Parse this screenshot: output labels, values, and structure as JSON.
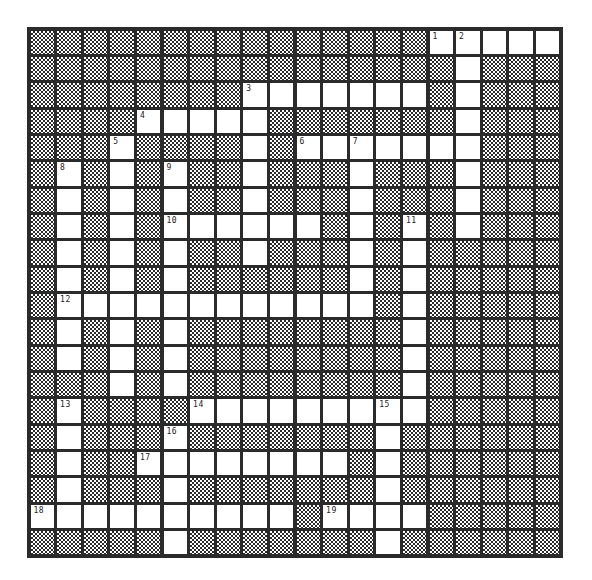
{
  "puzzle": {
    "type": "crossword",
    "rows": 20,
    "cols": 20,
    "open_cells": [
      [
        15,
        16,
        17,
        18,
        19
      ],
      [
        16
      ],
      [
        8,
        9,
        10,
        11,
        12,
        13,
        14,
        16
      ],
      [
        4,
        5,
        6,
        7,
        8,
        16
      ],
      [
        3,
        8,
        10,
        11,
        12,
        13,
        14,
        15,
        16
      ],
      [
        1,
        3,
        5,
        8,
        12,
        16
      ],
      [
        1,
        3,
        5,
        8,
        12,
        16
      ],
      [
        1,
        3,
        5,
        6,
        7,
        8,
        9,
        10,
        12,
        14,
        16
      ],
      [
        1,
        3,
        5,
        8,
        12,
        14
      ],
      [
        1,
        3,
        5,
        12,
        14
      ],
      [
        1,
        2,
        3,
        4,
        5,
        6,
        7,
        8,
        9,
        10,
        11,
        12,
        14
      ],
      [
        1,
        3,
        5,
        14
      ],
      [
        1,
        3,
        5,
        14
      ],
      [
        3,
        5,
        14
      ],
      [
        1,
        6,
        7,
        8,
        9,
        10,
        11,
        12,
        13,
        14
      ],
      [
        1,
        5,
        13
      ],
      [
        1,
        4,
        5,
        6,
        7,
        8,
        9,
        10,
        11,
        13
      ],
      [
        1,
        5,
        13
      ],
      [
        0,
        1,
        2,
        3,
        4,
        5,
        6,
        7,
        8,
        9,
        11,
        12,
        13,
        14
      ],
      [
        5,
        13
      ]
    ],
    "clue_numbers": [
      {
        "number": "1",
        "row": 0,
        "col": 15
      },
      {
        "number": "2",
        "row": 0,
        "col": 16
      },
      {
        "number": "3",
        "row": 2,
        "col": 8
      },
      {
        "number": "4",
        "row": 3,
        "col": 4
      },
      {
        "number": "5",
        "row": 4,
        "col": 3
      },
      {
        "number": "6",
        "row": 4,
        "col": 10
      },
      {
        "number": "7",
        "row": 4,
        "col": 12
      },
      {
        "number": "8",
        "row": 5,
        "col": 1
      },
      {
        "number": "9",
        "row": 5,
        "col": 5
      },
      {
        "number": "10",
        "row": 7,
        "col": 5
      },
      {
        "number": "11",
        "row": 7,
        "col": 14
      },
      {
        "number": "12",
        "row": 10,
        "col": 1
      },
      {
        "number": "13",
        "row": 14,
        "col": 1
      },
      {
        "number": "14",
        "row": 14,
        "col": 6
      },
      {
        "number": "15",
        "row": 14,
        "col": 13
      },
      {
        "number": "16",
        "row": 15,
        "col": 5
      },
      {
        "number": "17",
        "row": 16,
        "col": 4
      },
      {
        "number": "18",
        "row": 18,
        "col": 0
      },
      {
        "number": "19",
        "row": 18,
        "col": 11
      }
    ],
    "colors": {
      "grid_line": "#2b2b2b",
      "open_cell": "#ffffff",
      "block_pattern": "checkerboard"
    }
  }
}
